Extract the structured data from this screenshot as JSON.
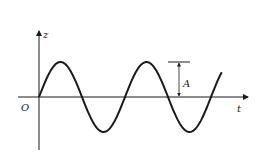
{
  "diagram": {
    "type": "sine-wave",
    "axes": {
      "vertical_label": "z",
      "horizontal_label": "t",
      "origin_label": "O"
    },
    "amplitude_label": "A",
    "wave": {
      "periods_shown": 2.5,
      "amplitude_px": 35,
      "period_px": 86
    },
    "colors": {
      "line": "#1a1a1a",
      "background": "#ffffff"
    }
  }
}
